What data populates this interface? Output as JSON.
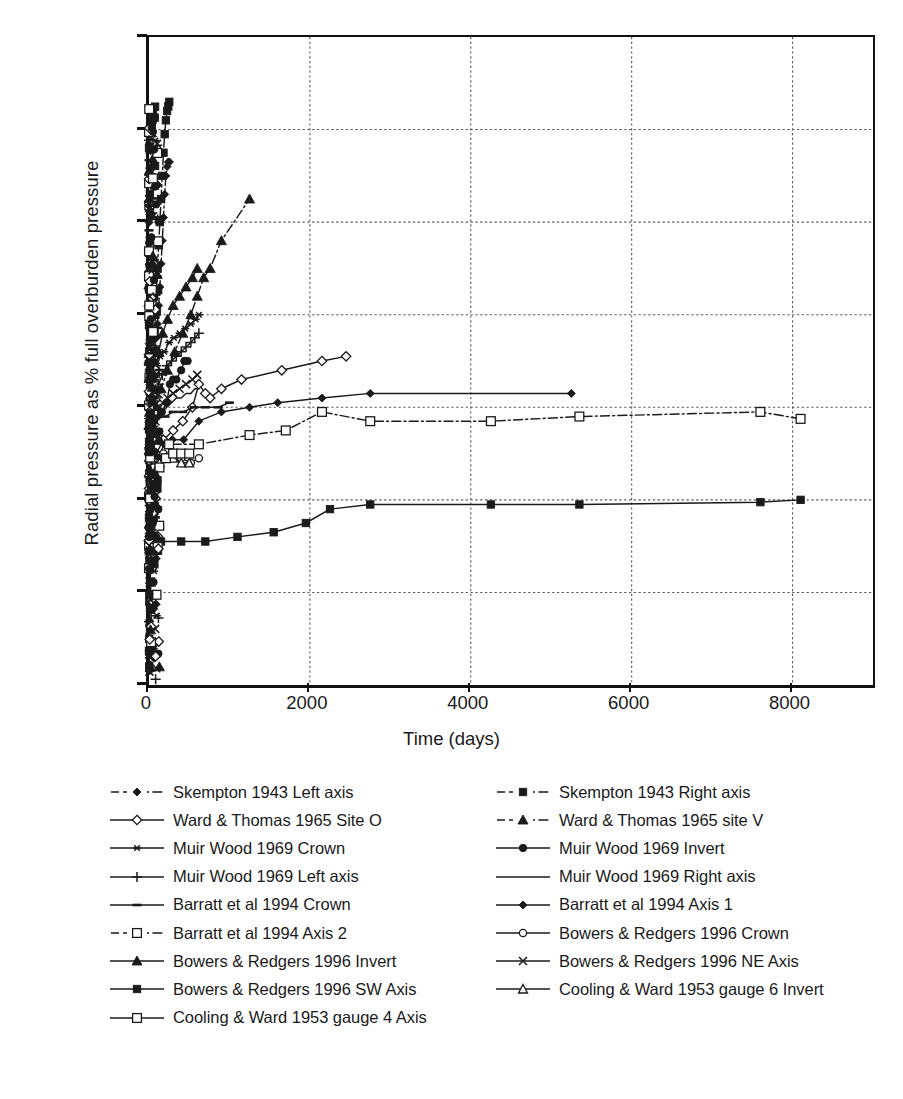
{
  "chart_data": {
    "type": "line",
    "title": "",
    "xlabel": "Time (days)",
    "ylabel": "Radial pressure as % full overburden pressure",
    "xlim": [
      0,
      9000
    ],
    "ylim": [
      0,
      140
    ],
    "xticks": [
      0,
      2000,
      4000,
      6000,
      8000
    ],
    "xtick_labels": [
      "0",
      "2000",
      "4000",
      "6000",
      "8000"
    ],
    "yticks": [
      0,
      20,
      40,
      60,
      80,
      100,
      120,
      140
    ],
    "ytick_labels": [
      "0%",
      "20%",
      "40%",
      "60%",
      "80%",
      "100%",
      "120%",
      "140%"
    ],
    "grid": true,
    "grid_style": "dotted",
    "legend_position": "below-plot-two-columns",
    "series": [
      {
        "name": "Skempton 1943 Left axis",
        "marker": "filled-diamond",
        "line": "dash-dot",
        "points": [
          [
            2,
            3
          ],
          [
            3,
            8
          ],
          [
            4,
            14
          ],
          [
            5,
            22
          ],
          [
            7,
            31
          ],
          [
            9,
            37
          ],
          [
            11,
            43
          ],
          [
            13,
            48
          ],
          [
            15,
            52
          ],
          [
            18,
            56
          ],
          [
            21,
            58
          ],
          [
            24,
            57
          ],
          [
            28,
            56
          ],
          [
            33,
            57
          ],
          [
            38,
            59
          ],
          [
            44,
            61
          ],
          [
            52,
            63
          ],
          [
            61,
            66
          ],
          [
            70,
            69
          ],
          [
            80,
            72
          ],
          [
            92,
            75
          ],
          [
            105,
            78
          ],
          [
            120,
            82
          ],
          [
            135,
            86
          ],
          [
            150,
            91
          ],
          [
            165,
            96
          ],
          [
            180,
            101
          ],
          [
            195,
            106
          ],
          [
            210,
            110
          ],
          [
            225,
            112
          ],
          [
            240,
            113
          ],
          [
            255,
            113
          ]
        ]
      },
      {
        "name": "Skempton 1943 Right axis",
        "marker": "filled-square",
        "line": "dash-dot",
        "points": [
          [
            2,
            4
          ],
          [
            3,
            10
          ],
          [
            4,
            18
          ],
          [
            5,
            27
          ],
          [
            7,
            36
          ],
          [
            9,
            44
          ],
          [
            11,
            50
          ],
          [
            13,
            55
          ],
          [
            15,
            58
          ],
          [
            18,
            60
          ],
          [
            21,
            59
          ],
          [
            24,
            57
          ],
          [
            28,
            56
          ],
          [
            33,
            58
          ],
          [
            38,
            61
          ],
          [
            44,
            64
          ],
          [
            52,
            68
          ],
          [
            61,
            72
          ],
          [
            70,
            76
          ],
          [
            80,
            80
          ],
          [
            92,
            85
          ],
          [
            105,
            90
          ],
          [
            120,
            95
          ],
          [
            135,
            100
          ],
          [
            150,
            105
          ],
          [
            165,
            110
          ],
          [
            180,
            115
          ],
          [
            195,
            119
          ],
          [
            210,
            122
          ],
          [
            225,
            124
          ],
          [
            240,
            125
          ],
          [
            252,
            126
          ]
        ]
      },
      {
        "name": "Ward & Thomas 1965 Site O",
        "marker": "open-diamond",
        "line": "solid",
        "points": [
          [
            30,
            48
          ],
          [
            90,
            50
          ],
          [
            180,
            53
          ],
          [
            300,
            55
          ],
          [
            420,
            57
          ],
          [
            540,
            60
          ],
          [
            620,
            65
          ],
          [
            700,
            63
          ],
          [
            760,
            62
          ],
          [
            900,
            64
          ],
          [
            1150,
            66
          ],
          [
            1650,
            68
          ],
          [
            2150,
            70
          ],
          [
            2450,
            71
          ]
        ]
      },
      {
        "name": "Ward & Thomas 1965 site V",
        "marker": "filled-triangle",
        "line": "dash-dot",
        "points": [
          [
            30,
            56
          ],
          [
            80,
            60
          ],
          [
            150,
            64
          ],
          [
            230,
            68
          ],
          [
            320,
            72
          ],
          [
            420,
            76
          ],
          [
            520,
            80
          ],
          [
            600,
            84
          ],
          [
            680,
            88
          ],
          [
            760,
            90
          ],
          [
            900,
            96
          ],
          [
            1250,
            105
          ]
        ]
      },
      {
        "name": "Muir Wood 1969 Crown",
        "marker": "asterisk",
        "line": "solid",
        "points": [
          [
            10,
            56
          ],
          [
            25,
            60
          ],
          [
            45,
            64
          ],
          [
            70,
            67
          ],
          [
            100,
            69
          ],
          [
            140,
            71
          ],
          [
            190,
            72
          ],
          [
            250,
            74
          ],
          [
            310,
            75
          ],
          [
            380,
            76
          ],
          [
            450,
            77
          ],
          [
            520,
            78
          ],
          [
            580,
            79
          ],
          [
            620,
            80
          ]
        ]
      },
      {
        "name": "Muir Wood 1969 Invert",
        "marker": "filled-circle",
        "line": "solid",
        "points": [
          [
            10,
            52
          ],
          [
            30,
            55
          ],
          [
            60,
            57
          ],
          [
            100,
            58
          ],
          [
            160,
            59
          ],
          [
            220,
            61
          ],
          [
            260,
            65
          ],
          [
            300,
            66
          ],
          [
            340,
            66
          ],
          [
            400,
            68
          ],
          [
            440,
            70
          ],
          [
            480,
            70
          ]
        ]
      },
      {
        "name": "Muir Wood 1969 Left axis",
        "marker": "plus",
        "line": "solid",
        "points": [
          [
            10,
            52
          ],
          [
            30,
            56
          ],
          [
            55,
            59
          ],
          [
            85,
            62
          ],
          [
            120,
            65
          ],
          [
            165,
            67
          ],
          [
            220,
            69
          ],
          [
            280,
            70
          ],
          [
            340,
            71
          ],
          [
            400,
            72
          ],
          [
            460,
            73
          ],
          [
            520,
            74
          ],
          [
            570,
            75
          ],
          [
            620,
            76
          ]
        ]
      },
      {
        "name": "Muir Wood 1969 Right axis",
        "marker": "none",
        "line": "solid",
        "points": [
          [
            10,
            50
          ],
          [
            30,
            53
          ],
          [
            55,
            55
          ],
          [
            85,
            57
          ],
          [
            120,
            58
          ],
          [
            165,
            59
          ],
          [
            220,
            60
          ],
          [
            280,
            61
          ],
          [
            340,
            62
          ],
          [
            400,
            62
          ],
          [
            460,
            63
          ],
          [
            520,
            63
          ],
          [
            570,
            64
          ],
          [
            620,
            64
          ]
        ]
      },
      {
        "name": "Barratt et al 1994 Crown",
        "marker": "short-dash",
        "line": "solid",
        "points": [
          [
            20,
            56
          ],
          [
            60,
            57
          ],
          [
            120,
            58
          ],
          [
            200,
            58
          ],
          [
            300,
            59
          ],
          [
            420,
            59
          ],
          [
            560,
            60
          ],
          [
            700,
            60
          ],
          [
            860,
            60
          ],
          [
            1000,
            61
          ]
        ]
      },
      {
        "name": "Barratt et al 1994 Axis 1",
        "marker": "filled-diamond",
        "line": "solid",
        "points": [
          [
            25,
            41
          ],
          [
            60,
            45
          ],
          [
            110,
            49
          ],
          [
            190,
            52
          ],
          [
            290,
            53
          ],
          [
            430,
            53
          ],
          [
            620,
            57
          ],
          [
            900,
            59
          ],
          [
            1250,
            60
          ],
          [
            1600,
            61
          ],
          [
            2150,
            62
          ],
          [
            2750,
            63
          ],
          [
            5250,
            63
          ]
        ]
      },
      {
        "name": "Barratt et al 1994 Axis 2",
        "marker": "open-square",
        "line": "dash-dot",
        "points": [
          [
            80,
            53
          ],
          [
            250,
            52
          ],
          [
            620,
            52
          ],
          [
            1250,
            54
          ],
          [
            1700,
            55
          ],
          [
            2150,
            59
          ],
          [
            2750,
            57
          ],
          [
            4250,
            57
          ],
          [
            5350,
            58
          ],
          [
            7600,
            59
          ],
          [
            8100,
            57.5
          ]
        ]
      },
      {
        "name": "Bowers & Redgers 1996 Crown",
        "marker": "open-circle",
        "line": "solid",
        "points": [
          [
            5,
            40
          ],
          [
            20,
            44
          ],
          [
            50,
            47
          ],
          [
            100,
            49
          ],
          [
            180,
            50
          ],
          [
            280,
            50
          ],
          [
            400,
            49
          ],
          [
            520,
            48
          ],
          [
            620,
            49
          ]
        ]
      },
      {
        "name": "Bowers & Redgers 1996 Invert",
        "marker": "filled-triangle",
        "line": "solid",
        "points": [
          [
            5,
            52
          ],
          [
            20,
            58
          ],
          [
            45,
            63
          ],
          [
            80,
            68
          ],
          [
            120,
            72
          ],
          [
            170,
            76
          ],
          [
            230,
            79
          ],
          [
            300,
            82
          ],
          [
            380,
            84
          ],
          [
            460,
            86
          ],
          [
            540,
            88
          ],
          [
            600,
            90
          ]
        ]
      },
      {
        "name": "Bowers & Redgers 1996 NE Axis",
        "marker": "cross",
        "line": "solid",
        "points": [
          [
            5,
            45
          ],
          [
            20,
            50
          ],
          [
            45,
            54
          ],
          [
            80,
            57
          ],
          [
            120,
            59
          ],
          [
            170,
            61
          ],
          [
            230,
            62
          ],
          [
            300,
            63
          ],
          [
            380,
            64
          ],
          [
            460,
            65
          ],
          [
            540,
            66
          ],
          [
            600,
            67
          ]
        ]
      },
      {
        "name": "Bowers & Redgers 1996 SW Axis",
        "marker": "filled-square",
        "line": "solid",
        "points": [
          [
            10,
            31
          ],
          [
            150,
            31
          ],
          [
            400,
            31
          ],
          [
            700,
            31
          ],
          [
            1100,
            32
          ],
          [
            1550,
            33
          ],
          [
            1950,
            35
          ],
          [
            2250,
            38
          ],
          [
            2750,
            39
          ],
          [
            4250,
            39
          ],
          [
            5350,
            39
          ],
          [
            7600,
            39.5
          ],
          [
            8100,
            40
          ]
        ]
      },
      {
        "name": "Cooling & Ward 1953 gauge 6 Invert",
        "marker": "open-triangle",
        "line": "solid",
        "points": [
          [
            5,
            35
          ],
          [
            30,
            42
          ],
          [
            70,
            46
          ],
          [
            130,
            48
          ],
          [
            210,
            49
          ],
          [
            300,
            49
          ],
          [
            400,
            48
          ],
          [
            500,
            48
          ]
        ]
      },
      {
        "name": "Cooling & Ward 1953 gauge 4 Axis",
        "marker": "open-square",
        "line": "solid",
        "points": [
          [
            5,
            30
          ],
          [
            30,
            38
          ],
          [
            70,
            44
          ],
          [
            130,
            47
          ],
          [
            210,
            49
          ],
          [
            300,
            50
          ],
          [
            400,
            50
          ],
          [
            500,
            50
          ]
        ]
      }
    ],
    "dense_cluster_note": "Very dense overlapping data points clustered at t<200 days spanning 0%-126%"
  },
  "legend": {
    "left_column": [
      {
        "label": "Skempton 1943 Left axis",
        "marker": "filled-diamond",
        "line": "dash-dot"
      },
      {
        "label": "Ward & Thomas 1965 Site O",
        "marker": "open-diamond",
        "line": "solid"
      },
      {
        "label": "Muir Wood 1969 Crown",
        "marker": "asterisk",
        "line": "solid"
      },
      {
        "label": "Muir Wood 1969 Left axis",
        "marker": "plus",
        "line": "solid"
      },
      {
        "label": "Barratt et al 1994 Crown",
        "marker": "short-dash",
        "line": "solid"
      },
      {
        "label": "Barratt et al 1994 Axis 2",
        "marker": "open-square",
        "line": "dash-dot"
      },
      {
        "label": "Bowers & Redgers 1996 Invert",
        "marker": "filled-triangle",
        "line": "solid"
      },
      {
        "label": "Bowers & Redgers 1996 SW Axis",
        "marker": "filled-square",
        "line": "solid"
      },
      {
        "label": "Cooling & Ward 1953 gauge 4 Axis",
        "marker": "open-square",
        "line": "solid"
      }
    ],
    "right_column": [
      {
        "label": "Skempton 1943 Right axis",
        "marker": "filled-square",
        "line": "dash-dot"
      },
      {
        "label": "Ward & Thomas 1965 site V",
        "marker": "filled-triangle",
        "line": "dash-dot"
      },
      {
        "label": "Muir Wood 1969 Invert",
        "marker": "filled-circle",
        "line": "solid"
      },
      {
        "label": "Muir Wood 1969 Right axis",
        "marker": "none",
        "line": "solid"
      },
      {
        "label": "Barratt et al 1994 Axis 1",
        "marker": "filled-diamond",
        "line": "solid"
      },
      {
        "label": "Bowers & Redgers 1996 Crown",
        "marker": "open-circle",
        "line": "solid"
      },
      {
        "label": "Bowers & Redgers 1996 NE Axis",
        "marker": "cross",
        "line": "solid"
      },
      {
        "label": "Cooling & Ward 1953 gauge 6 Invert",
        "marker": "open-triangle",
        "line": "solid"
      }
    ]
  },
  "colors": {
    "ink": "#1a1a1a",
    "axis": "#111111",
    "grid": "#555555",
    "background": "#ffffff"
  }
}
